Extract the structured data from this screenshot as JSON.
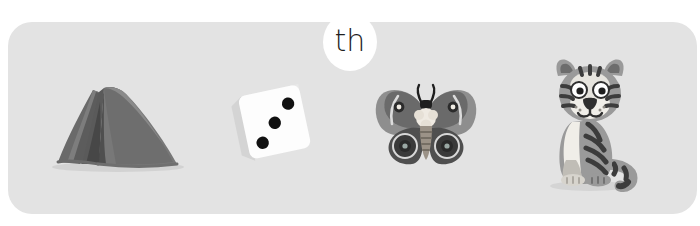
{
  "card": {
    "background_color": "#e3e3e3",
    "corner_radius_px": 24
  },
  "badge": {
    "label": "th",
    "name": "phoneme-badge",
    "background_color": "#ffffff",
    "text_color": "#1f1f1f"
  },
  "items": [
    {
      "id": "tent",
      "label": "tent",
      "icon": "tent-illustration",
      "colors": {
        "canopy_light": "#8c8c8c",
        "canopy_mid": "#6f6f6f",
        "canopy_dark": "#5b5b5b",
        "shadow": "#cfcfcf"
      }
    },
    {
      "id": "dice",
      "label": "dice",
      "icon": "dice-illustration",
      "pips": 3,
      "rotation_deg": -12,
      "colors": {
        "face": "#fdfdfd",
        "side": "#d7d7d7",
        "pip": "#111111"
      }
    },
    {
      "id": "moth",
      "label": "moth",
      "icon": "moth-illustration",
      "colors": {
        "wing_outer": "#8e8e8e",
        "wing_inner": "#5e5e5e",
        "wing_dark": "#4a4a4a",
        "eyespot": "#2b2b2b",
        "thorax": "#efeae2",
        "abdomen": "#8a8379"
      }
    },
    {
      "id": "tiger",
      "label": "tiger",
      "icon": "tiger-illustration",
      "colors": {
        "fur": "#9a9a9a",
        "fur_light": "#b6b6b6",
        "belly": "#f2f0ea",
        "stripe": "#3c3c3c",
        "nose": "#2f2f2f",
        "eye_white": "#ffffff"
      }
    }
  ]
}
